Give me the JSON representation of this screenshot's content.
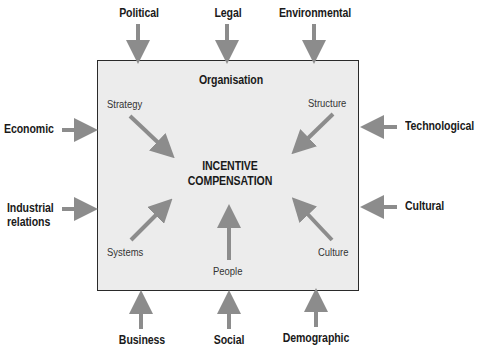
{
  "diagram": {
    "box_title": "Organisation",
    "centre": {
      "line1": "INCENTIVE",
      "line2": "COMPENSATION"
    },
    "internal_factors": {
      "strategy": "Strategy",
      "structure": "Structure",
      "systems": "Systems",
      "people": "People",
      "culture": "Culture"
    },
    "external_factors": {
      "top": [
        "Political",
        "Legal",
        "Environmental"
      ],
      "left": [
        "Economic",
        "Industrial relations"
      ],
      "left_industrial_line1": "Industrial",
      "left_industrial_line2": "relations",
      "right": [
        "Technological",
        "Cultural"
      ],
      "bottom": [
        "Business",
        "Social",
        "Demographic"
      ]
    },
    "colors": {
      "arrow": "#8c8c8c",
      "box_fill": "#ececec",
      "box_border": "#2a2a2a",
      "text": "#1a1a1a"
    }
  }
}
